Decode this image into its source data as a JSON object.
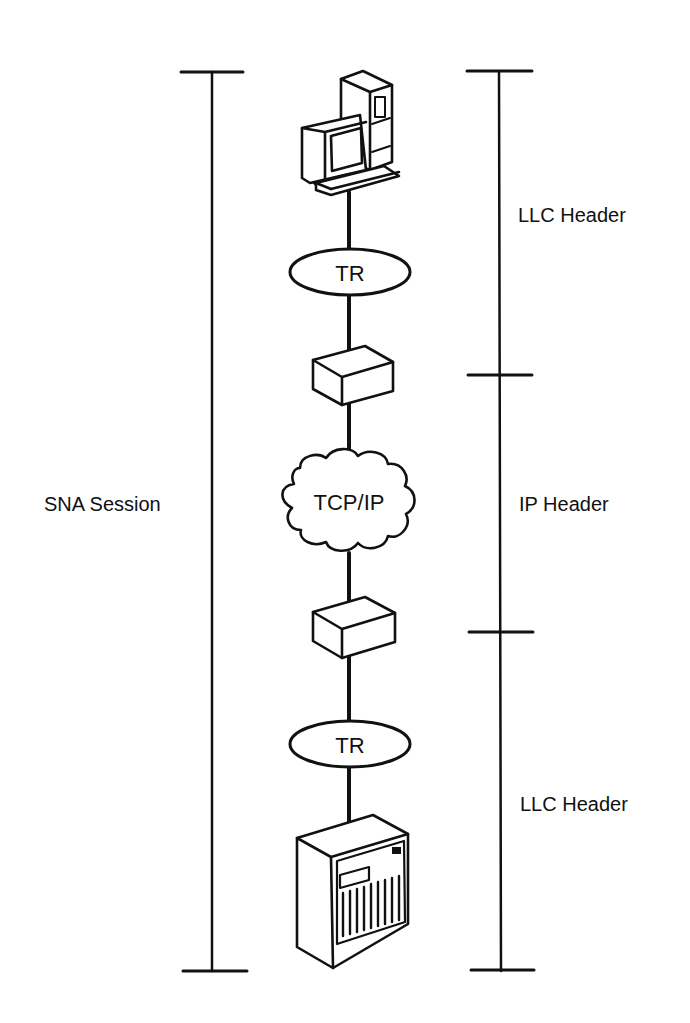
{
  "diagram": {
    "type": "network-layer-diagram",
    "colors": {
      "ink": "#111111",
      "background": "#ffffff"
    },
    "nodes": [
      {
        "id": "workstation",
        "icon": "desktop-computer-icon",
        "label": ""
      },
      {
        "id": "tr-top",
        "shape": "ellipse",
        "label": "TR"
      },
      {
        "id": "router-top",
        "icon": "router-box-icon",
        "label": ""
      },
      {
        "id": "tcpip",
        "shape": "cloud",
        "label": "TCP/IP"
      },
      {
        "id": "router-bottom",
        "icon": "router-box-icon",
        "label": ""
      },
      {
        "id": "tr-bottom",
        "shape": "ellipse",
        "label": "TR"
      },
      {
        "id": "host",
        "icon": "mainframe-host-icon",
        "label": ""
      }
    ],
    "edges": [
      [
        "workstation",
        "tr-top"
      ],
      [
        "tr-top",
        "router-top"
      ],
      [
        "router-top",
        "tcpip"
      ],
      [
        "tcpip",
        "router-bottom"
      ],
      [
        "router-bottom",
        "tr-bottom"
      ],
      [
        "tr-bottom",
        "host"
      ]
    ],
    "left_bracket": {
      "label": "SNA Session",
      "spans": [
        "workstation",
        "host"
      ]
    },
    "right_brackets": [
      {
        "label": "LLC Header",
        "spans": [
          "workstation",
          "router-top"
        ]
      },
      {
        "label": "IP Header",
        "spans": [
          "router-top",
          "router-bottom"
        ]
      },
      {
        "label": "LLC Header",
        "spans": [
          "router-bottom",
          "host"
        ]
      }
    ]
  }
}
